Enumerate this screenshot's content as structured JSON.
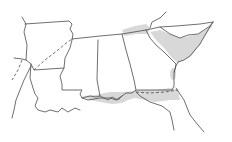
{
  "map": {
    "type": "outline-map",
    "region": "Southeastern United States",
    "background": "#ffffff",
    "line_color": "#4a4a4a",
    "shade_color": "#d4d4d4",
    "states": [
      {
        "name": "Arkansas",
        "id": "ar"
      },
      {
        "name": "Louisiana",
        "id": "la"
      },
      {
        "name": "Mississippi",
        "id": "ms"
      },
      {
        "name": "Alabama",
        "id": "al"
      },
      {
        "name": "Georgia",
        "id": "ga"
      },
      {
        "name": "South Carolina",
        "id": "sc"
      },
      {
        "name": "Tennessee",
        "id": "tn"
      },
      {
        "name": "Florida",
        "id": "fl"
      }
    ],
    "shaded_regions": [
      {
        "id": "sc-coast",
        "description": "South Carolina / Georgia coastal plain band"
      },
      {
        "id": "nc-tn-border",
        "description": "Small shaded area near NC-TN border"
      },
      {
        "id": "gulf-coast",
        "description": "Florida panhandle / Gulf coast band"
      },
      {
        "id": "ga-south",
        "description": "Small shaded oval in south Georgia"
      }
    ]
  }
}
